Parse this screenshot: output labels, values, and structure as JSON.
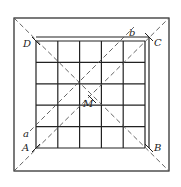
{
  "diagram": {
    "grid": {
      "rows": 5,
      "cols": 5
    },
    "points": {
      "A": "A",
      "B": "B",
      "C": "C",
      "D": "D",
      "M": "M",
      "a": "a",
      "b": "b"
    },
    "colors": {
      "line": "#222222",
      "dashed": "#555555",
      "background": "#ffffff"
    }
  }
}
